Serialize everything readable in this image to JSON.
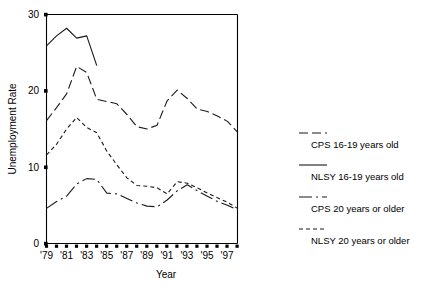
{
  "chart_data": {
    "type": "line",
    "title": "",
    "xlabel": "Year",
    "ylabel": "Unemployment Rate",
    "xlim": [
      1979,
      1998
    ],
    "ylim": [
      0,
      30
    ],
    "yticks": [
      0,
      10,
      20,
      30
    ],
    "ytick_labels": [
      "0",
      "10",
      "20",
      "30"
    ],
    "xticks": [
      1979,
      1980,
      1981,
      1982,
      1983,
      1984,
      1985,
      1986,
      1987,
      1988,
      1989,
      1990,
      1991,
      1992,
      1993,
      1994,
      1995,
      1996,
      1997,
      1998
    ],
    "xtick_labels": [
      "'79",
      "",
      "'81",
      "",
      "'83",
      "",
      "'85",
      "",
      "'87",
      "",
      "'89",
      "",
      "'91",
      "",
      "'93",
      "",
      "'95",
      "",
      "'97",
      ""
    ],
    "grid": false,
    "legend_position": "right",
    "series": [
      {
        "name": "CPS 16-19 years old",
        "style": "dashed",
        "x": [
          1979,
          1980,
          1981,
          1982,
          1983,
          1984,
          1985,
          1986,
          1987,
          1988,
          1989,
          1990,
          1991,
          1992,
          1993,
          1994,
          1995,
          1996,
          1997,
          1998
        ],
        "values": [
          16.1,
          17.8,
          19.6,
          23.2,
          22.4,
          18.9,
          18.6,
          18.3,
          16.9,
          15.3,
          15.0,
          15.5,
          18.7,
          20.1,
          19.0,
          17.6,
          17.3,
          16.7,
          16.0,
          14.6
        ]
      },
      {
        "name": "NLSY 16-19 years old",
        "style": "solid",
        "x": [
          1979,
          1980,
          1981,
          1982,
          1983,
          1984
        ],
        "values": [
          25.9,
          27.2,
          28.2,
          26.9,
          27.2,
          23.3
        ]
      },
      {
        "name": "CPS 20 years or older",
        "style": "dashdot",
        "x": [
          1979,
          1980,
          1981,
          1982,
          1983,
          1984,
          1985,
          1986,
          1987,
          1988,
          1989,
          1990,
          1991,
          1992,
          1993,
          1994,
          1995,
          1996,
          1997,
          1998
        ],
        "values": [
          4.6,
          5.5,
          6.2,
          7.8,
          8.5,
          8.4,
          6.6,
          6.5,
          5.9,
          5.3,
          4.9,
          4.8,
          5.7,
          6.9,
          7.7,
          6.9,
          6.2,
          5.5,
          5.0,
          4.4
        ]
      },
      {
        "name": "NLSY 20 years or older",
        "style": "dotted",
        "x": [
          1979,
          1980,
          1981,
          1982,
          1983,
          1984,
          1985,
          1986,
          1987,
          1988,
          1989,
          1990,
          1991,
          1992,
          1993,
          1994,
          1995,
          1996,
          1997,
          1998
        ],
        "values": [
          11.6,
          13.0,
          15.0,
          16.5,
          15.2,
          14.5,
          12.1,
          10.3,
          8.6,
          7.6,
          7.5,
          7.3,
          6.5,
          8.1,
          7.9,
          7.3,
          6.6,
          6.0,
          5.4,
          4.6
        ]
      }
    ]
  },
  "legend": {
    "items": [
      {
        "label": "CPS 16-19 years old",
        "style": "dashed"
      },
      {
        "label": "NLSY 16-19 years old",
        "style": "solid"
      },
      {
        "label": "CPS 20 years or older",
        "style": "dashdot"
      },
      {
        "label": "NLSY 20 years or older",
        "style": "dotted"
      }
    ]
  }
}
